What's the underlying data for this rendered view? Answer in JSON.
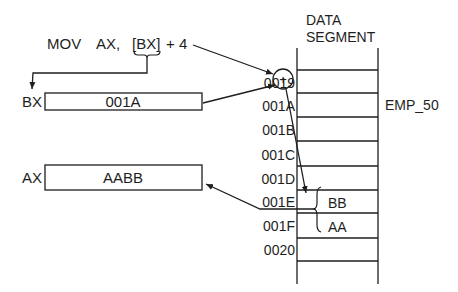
{
  "instruction": {
    "opcode": "MOV",
    "dest": "AX,",
    "src_reg": "[BX]",
    "offset": "+ 4"
  },
  "registers": [
    {
      "name": "BX",
      "value": "001A"
    },
    {
      "name": "AX",
      "value": "AABB"
    }
  ],
  "adder_symbol": "+",
  "segment": {
    "title_line1": "DATA",
    "title_line2": "SEGMENT",
    "addresses": [
      "0019",
      "001A",
      "001B",
      "001C",
      "001D",
      "001E",
      "001F",
      "0020"
    ],
    "cell_values": {
      "001E": "BB",
      "001F": "AA"
    },
    "label": {
      "address": "001A",
      "text": "EMP_50"
    }
  },
  "colors": {
    "line": "#1e1e1e",
    "background": "#ffffff"
  }
}
